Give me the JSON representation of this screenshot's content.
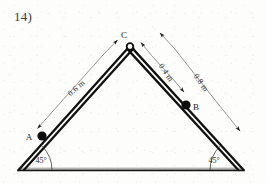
{
  "figure": {
    "problem_number": "14)",
    "colors": {
      "ink": "#1c1c1c",
      "member": "#111111",
      "dimension": "#4a4a4a",
      "background": "#fdfdfc"
    },
    "points": [
      {
        "id": "A",
        "label": "A",
        "type": "collar",
        "x": 42,
        "y": 136,
        "label_x": 30,
        "label_y": 139
      },
      {
        "id": "B",
        "label": "B",
        "type": "collar",
        "x": 186,
        "y": 105,
        "label_x": 194,
        "label_y": 110
      },
      {
        "id": "C",
        "label": "C",
        "type": "pin-joint",
        "x": 130,
        "y": 46,
        "label_x": 124,
        "label_y": 39
      }
    ],
    "supports": [
      {
        "id": "left-support",
        "x": 18,
        "y": 170
      },
      {
        "id": "right-support",
        "x": 244,
        "y": 170
      }
    ],
    "angles": [
      {
        "id": "left-angle",
        "label": "45°",
        "label_x": 41,
        "label_y": 163,
        "vertex_x": 18,
        "vertex_y": 170
      },
      {
        "id": "right-angle",
        "label": "45°",
        "label_x": 213,
        "label_y": 163,
        "vertex_x": 244,
        "vertex_y": 170
      }
    ],
    "dimensions": [
      {
        "id": "dim-ac",
        "label": "0.6 m",
        "value": 0.6,
        "unit": "m",
        "from": "A",
        "to": "C",
        "label_x": 78,
        "label_y": 90,
        "rotation": -40
      },
      {
        "id": "dim-cb",
        "label": "0.4 m",
        "value": 0.4,
        "unit": "m",
        "from": "C",
        "to": "B",
        "label_x": 166,
        "label_y": 77,
        "rotation": 56
      },
      {
        "id": "dim-c-base",
        "label": "0.8 m",
        "value": 0.8,
        "unit": "m",
        "from": "C",
        "to": "right-support",
        "label_x": 196,
        "label_y": 87,
        "rotation": 56
      }
    ],
    "members": [
      {
        "id": "member-left",
        "from": "left-support",
        "to": "C"
      },
      {
        "id": "member-right",
        "from": "C",
        "to": "right-support"
      },
      {
        "id": "member-base",
        "from": "left-support",
        "to": "right-support"
      }
    ]
  }
}
